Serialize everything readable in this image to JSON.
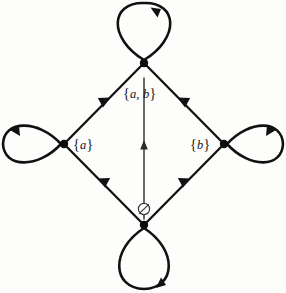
{
  "diagram": {
    "background_color": "#fdfdfb",
    "stroke_color": "#111111",
    "nodes": [
      {
        "id": "top",
        "label_open": "{",
        "label_text": "a, b",
        "label_close": "}",
        "label_plain": "{a, b}",
        "x": 144,
        "y": 63,
        "self_loop": "vertical-up",
        "self_loop_arrow": "clockwise-top-right"
      },
      {
        "id": "left",
        "label_open": "{",
        "label_text": "a",
        "label_close": "}",
        "label_plain": "{a}",
        "x": 64,
        "y": 144,
        "self_loop": "horizontal-left",
        "self_loop_arrow": "clockwise-top-left"
      },
      {
        "id": "right",
        "label_open": "{",
        "label_text": "b",
        "label_close": "}",
        "label_plain": "{b}",
        "x": 224,
        "y": 144,
        "self_loop": "horizontal-right",
        "self_loop_arrow": "clockwise-top-right"
      },
      {
        "id": "bottom",
        "label_open": "",
        "label_text": "∅",
        "label_close": "",
        "label_plain": "∅",
        "x": 144,
        "y": 225,
        "self_loop": "vertical-down",
        "self_loop_arrow": "clockwise-bottom-right"
      }
    ],
    "edges": [
      {
        "id": "bottom-to-left",
        "from": "bottom",
        "to": "left",
        "arrow": "midpoint-toward-left"
      },
      {
        "id": "bottom-to-right",
        "from": "bottom",
        "to": "right",
        "arrow": "midpoint-toward-right"
      },
      {
        "id": "left-to-top",
        "from": "left",
        "to": "top",
        "arrow": "midpoint-toward-top"
      },
      {
        "id": "right-to-top",
        "from": "right",
        "to": "top",
        "arrow": "midpoint-toward-top"
      },
      {
        "id": "bottom-to-top-direct",
        "from": "bottom",
        "to": "top",
        "arrow": "midpoint-upward",
        "style": "thin-vertical"
      }
    ],
    "empty_set_symbol": "∅"
  }
}
